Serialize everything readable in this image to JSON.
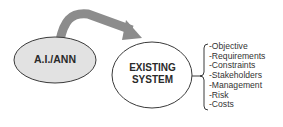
{
  "diagram": {
    "source_node": {
      "label": "A.I./ANN",
      "fill": "#e2e2e2",
      "stroke": "#3a3a3a"
    },
    "target_node": {
      "label_line1": "EXISTING",
      "label_line2": "SYSTEM",
      "fill": "#ffffff",
      "stroke": "#3a3a3a"
    },
    "arrow": {
      "from": "A.I./ANN",
      "to": "EXISTING SYSTEM",
      "color": "#8c8c8c"
    },
    "aspects": [
      "-Objective",
      "-Requirements",
      "-Constraints",
      "-Stakeholders",
      "-Management",
      "-Risk",
      "-Costs"
    ]
  }
}
